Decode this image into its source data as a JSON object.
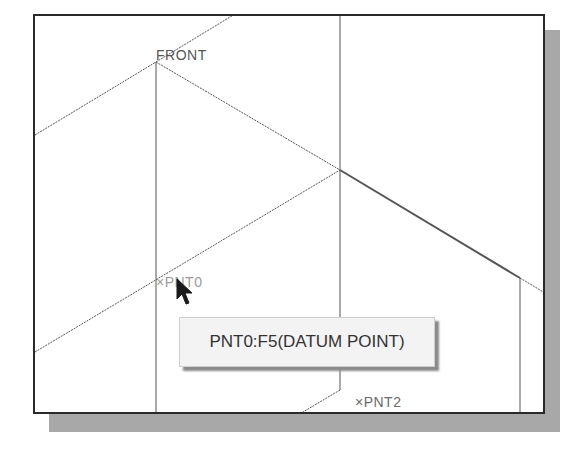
{
  "viewport": {
    "datum_plane_label": "FRONT",
    "points": [
      {
        "id": "pnt0",
        "label": "×PNT0",
        "highlighted": true
      },
      {
        "id": "pnt2",
        "label": "×PNT2",
        "highlighted": false
      }
    ]
  },
  "tooltip": {
    "text": "PNT0:F5(DATUM POINT)"
  },
  "colors": {
    "frame": "#2a2a2a",
    "shadow": "#a8a8a8",
    "line": "#555555",
    "tooltip_bg": "#f3f3f3"
  }
}
